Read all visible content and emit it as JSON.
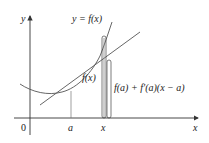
{
  "diagram": {
    "labels": {
      "y_axis": "y",
      "x_axis": "x",
      "origin": "0",
      "curve": "y = f(x)",
      "point_a": "a",
      "point_x": "x",
      "fx_bracket": "f(x)",
      "tangent_bracket": "f(a) + f′(a)(x − a)"
    },
    "colors": {
      "axes": "#333333",
      "curve": "#555555",
      "tangent": "#555555",
      "guides": "#777777",
      "brackets": "#444444",
      "text": "#222222"
    }
  }
}
